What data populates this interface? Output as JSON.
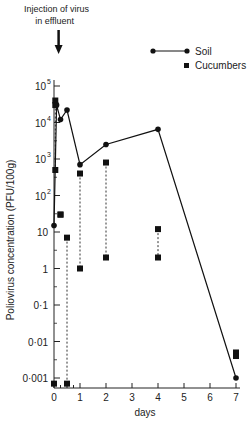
{
  "chart_data": {
    "type": "line",
    "title": "",
    "annotation": {
      "line1": "Injection of virus",
      "line2": "in effluent",
      "x": 0.1
    },
    "xlabel": "days",
    "ylabel": "Poliovirus concentration (PFU/100g)",
    "xlim": [
      0,
      7
    ],
    "ylim": [
      0.001,
      100000
    ],
    "yscale": "log",
    "x_ticks": [
      "0",
      "1",
      "2",
      "3",
      "4",
      "5",
      "6",
      "7"
    ],
    "y_ticks": [
      "0·001",
      "0·01",
      "0·1",
      "1",
      "10",
      "10²",
      "10³",
      "10⁴",
      "10⁵"
    ],
    "legend": [
      {
        "name": "Soil",
        "marker": "circle",
        "line": "solid"
      },
      {
        "name": "Cucumbers",
        "marker": "square",
        "line": "dashed-range"
      }
    ],
    "series": [
      {
        "name": "Soil",
        "x": [
          0,
          0.1,
          0.25,
          0.5,
          1,
          2,
          4,
          7
        ],
        "values": [
          15,
          30000,
          12000,
          22000,
          700,
          2500,
          6500,
          0.001
        ]
      },
      {
        "name": "Cucumbers",
        "ranges": [
          {
            "x": 0.05,
            "high": 40000,
            "low": 500
          },
          {
            "x": 0.25,
            "high": 30,
            "low": 30
          },
          {
            "x": 0.5,
            "high": 7,
            "low": 0.0007
          },
          {
            "x": 1,
            "high": 400,
            "low": 1
          },
          {
            "x": 2,
            "high": 800,
            "low": 2
          },
          {
            "x": 4,
            "high": 12,
            "low": 2
          },
          {
            "x": 7,
            "high": 0.005,
            "low": 0.004
          }
        ],
        "extra_points": [
          {
            "x": 0,
            "y": 0.0007
          },
          {
            "x": 0.05,
            "y": 30000
          }
        ]
      }
    ]
  }
}
